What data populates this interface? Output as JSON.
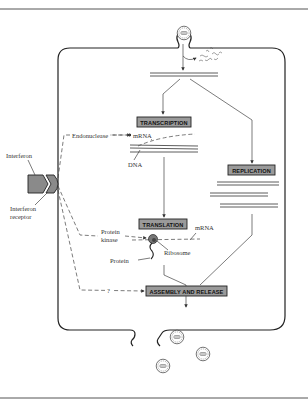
{
  "diagram": {
    "colors": {
      "background": "#ffffff",
      "line": "#333333",
      "process_box_fill": "#9a9a9a",
      "receptor_fill": "#8a8a8a",
      "frame_rule": "#555555"
    },
    "process_boxes": {
      "transcription": "TRANSCRIPTION",
      "replication": "REPLICATION",
      "translation": "TRANSLATION",
      "assembly": "ASSEMBLY AND RELEASE"
    },
    "labels": {
      "interferon": "Interferon",
      "receptor_line1": "Interferon",
      "receptor_line2": "receptor",
      "endonuclease": "Endonuclease",
      "mrna_top": "mRNA",
      "dna": "DNA",
      "protein_kinase_line1": "Protein",
      "protein_kinase_line2": "kinase",
      "mrna_bottom": "mRNA",
      "ribosome": "Ribosome",
      "protein": "Protein",
      "question_mark": "?"
    },
    "icons": {
      "entering_virus": "virus-particle-icon",
      "released_viruses": [
        "virus-particle-icon",
        "virus-particle-icon",
        "virus-particle-icon"
      ],
      "uncoated_capsid": "capsid-fragments-icon",
      "ribosome": "ribosome-icon"
    }
  }
}
